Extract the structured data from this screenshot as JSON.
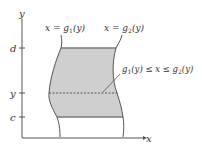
{
  "diagram": {
    "type": "region-between-curves",
    "axes": {
      "x_label": "x",
      "y_label": "y"
    },
    "y_ticks": [
      {
        "label": "d",
        "role": "upper-bound"
      },
      {
        "label": "y",
        "role": "cross-section"
      },
      {
        "label": "c",
        "role": "lower-bound"
      }
    ],
    "curves": {
      "left": {
        "lhs": "x = g",
        "sub": "1",
        "rhs": "(y)"
      },
      "right": {
        "lhs": "x = g",
        "sub": "2",
        "rhs": "(y)"
      }
    },
    "annotation": {
      "part1": "g",
      "sub1": "1",
      "part2": "(y) ≤ x ≤ g",
      "sub2": "2",
      "part3": "(y)"
    },
    "colors": {
      "region_fill": "#cfcfcf",
      "stroke": "#555555",
      "edge": "#7a7a7a"
    }
  }
}
